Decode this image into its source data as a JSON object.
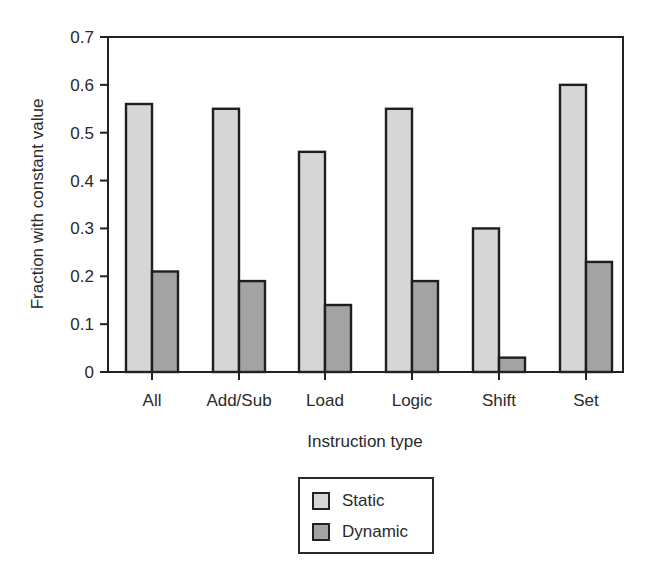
{
  "chart_data": {
    "type": "bar",
    "title": "",
    "xlabel": "Instruction type",
    "ylabel": "Fraction with constant value",
    "categories": [
      "All",
      "Add/Sub",
      "Load",
      "Logic",
      "Shift",
      "Set"
    ],
    "series": [
      {
        "name": "Static",
        "color": "#d6d6d6",
        "values": [
          0.56,
          0.55,
          0.46,
          0.55,
          0.3,
          0.6
        ]
      },
      {
        "name": "Dynamic",
        "color": "#a3a3a3",
        "values": [
          0.21,
          0.19,
          0.14,
          0.19,
          0.03,
          0.23
        ]
      }
    ],
    "ylim": [
      0,
      0.7
    ],
    "yticks": [
      "0",
      "0.1",
      "0.2",
      "0.3",
      "0.4",
      "0.5",
      "0.6",
      "0.7"
    ],
    "grid": false,
    "legend_position": "below"
  },
  "legend": {
    "static_label": "Static",
    "dynamic_label": "Dynamic"
  }
}
